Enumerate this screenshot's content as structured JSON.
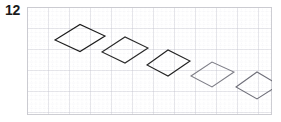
{
  "figure": {
    "problem_number": "12",
    "panel": {
      "x": 27,
      "y": 7,
      "width": 245,
      "height": 108,
      "background": "#ffffff",
      "border_color": "#c9c9cf"
    },
    "grid": {
      "minor_spacing": 4.2,
      "major_spacing": 21,
      "minor_color": "#dcdce4",
      "major_color": "#b9b9c4",
      "minor_style": "dotted",
      "major_style": "solid",
      "grid_on": true
    },
    "shapes": [
      {
        "name": "rhombus-1",
        "type": "rhombus",
        "cx": 53,
        "cy": 31,
        "half_width": 25,
        "half_height": 13.5,
        "skew": 0,
        "stroke": "#1d1d1d",
        "stroke_width": 1.15,
        "fill": "none",
        "points": "28,33 53,17.5 78,29 53,44.5"
      },
      {
        "name": "rhombus-2",
        "type": "rhombus",
        "cx": 98,
        "cy": 43,
        "half_width": 23,
        "half_height": 13,
        "skew": 0,
        "stroke": "#2a2a2a",
        "stroke_width": 1.1,
        "fill": "none",
        "points": "75,45 98,30 121,41 98,56"
      },
      {
        "name": "rhombus-3",
        "type": "rhombus",
        "cx": 141,
        "cy": 56,
        "half_width": 21.5,
        "half_height": 13,
        "skew": 0,
        "stroke": "#232323",
        "stroke_width": 1.1,
        "fill": "none",
        "points": "120,58 141,43 163,54 141,69"
      },
      {
        "name": "rhombus-4",
        "type": "rhombus",
        "cx": 185,
        "cy": 67,
        "half_width": 21.5,
        "half_height": 12.5,
        "skew": 0,
        "stroke": "#7d7d86",
        "stroke_width": 1.05,
        "fill": "none",
        "points": "164,69 185,55 207,65 185,80"
      },
      {
        "name": "rhombus-5",
        "type": "rhombus",
        "cx": 230,
        "cy": 79,
        "half_width": 21.5,
        "half_height": 13.5,
        "skew": 0,
        "stroke": "#6f6f79",
        "stroke_width": 1.05,
        "fill": "none",
        "points": "209,80 230,65 252,78 230,92"
      }
    ]
  },
  "chart_data": {
    "type": "scatter",
    "title": "",
    "xlabel": "",
    "ylabel": "",
    "grid": true,
    "legend": "none",
    "x": [
      53,
      98,
      141,
      185,
      230
    ],
    "y": [
      31,
      43,
      56,
      67,
      79
    ],
    "series": [
      {
        "name": "rhombus-centers",
        "values": [
          31,
          43,
          56,
          67,
          79
        ]
      }
    ],
    "categories": [
      "rhombus-1",
      "rhombus-2",
      "rhombus-3",
      "rhombus-4",
      "rhombus-5"
    ],
    "xlim": [
      0,
      245
    ],
    "ylim": [
      0,
      108
    ]
  }
}
